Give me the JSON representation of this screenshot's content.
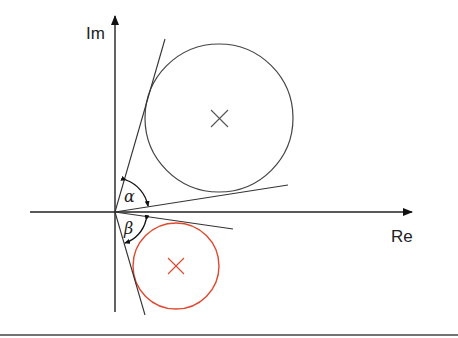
{
  "diagram": {
    "type": "complex-plane tangent angle diagram",
    "axes": {
      "x_label": "Re",
      "y_label": "Im",
      "origin": [
        115,
        212
      ]
    },
    "circles": [
      {
        "name": "upper-circle",
        "center": [
          219,
          118
        ],
        "radius": 74,
        "color": "#444444",
        "marker": "×"
      },
      {
        "name": "lower-circle",
        "center": [
          176,
          266
        ],
        "radius": 43,
        "color": "#e0472e",
        "marker": "×"
      }
    ],
    "angles": [
      {
        "name": "alpha",
        "label": "α"
      },
      {
        "name": "beta",
        "label": "β"
      }
    ],
    "colors": {
      "line": "#333333",
      "accent": "#e0472e"
    }
  }
}
